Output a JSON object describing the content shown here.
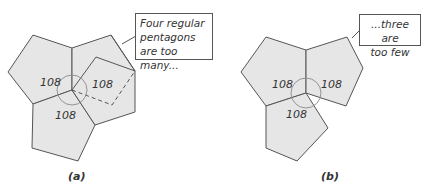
{
  "panels": [
    {
      "id": "a",
      "caption": "(a)",
      "callout": "Four regular pentagons are too many...",
      "callout_lines": [
        "Four regular",
        "pentagons",
        "are too many..."
      ],
      "angle_labels": [
        "108",
        "108",
        "108"
      ],
      "pentagon_count_solid": 3,
      "pentagon_count_dashed": 1
    },
    {
      "id": "b",
      "caption": "(b)",
      "callout": "...three are too few",
      "callout_lines": [
        "...three are",
        "too few"
      ],
      "angle_labels": [
        "108",
        "108",
        "108"
      ],
      "pentagon_count_solid": 3
    }
  ],
  "colors": {
    "fill": "#e6e6e6",
    "stroke": "#555555"
  }
}
